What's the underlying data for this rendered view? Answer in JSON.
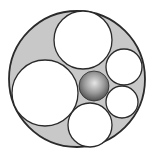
{
  "diagram": {
    "title": "",
    "colors": {
      "background": "#ffffff",
      "outer_fill": "#c8c8c8",
      "inner_fill": "#ffffff",
      "stroke": "#2a2a2a",
      "sphere_highlight": "#e6e6e6",
      "sphere_mid": "#9a9a9a",
      "sphere_edge": "#4a4a4a"
    },
    "outer_circle": {
      "cx": 77,
      "cy": 79,
      "r": 68
    },
    "inner_circles": [
      {
        "id": "top",
        "cx": 83,
        "cy": 40,
        "r": 29
      },
      {
        "id": "left-large",
        "cx": 45,
        "cy": 93,
        "r": 33
      },
      {
        "id": "right-upper",
        "cx": 124,
        "cy": 67,
        "r": 18
      },
      {
        "id": "right-lower",
        "cx": 122,
        "cy": 102,
        "r": 16
      },
      {
        "id": "bottom",
        "cx": 90,
        "cy": 125,
        "r": 22
      }
    ],
    "sphere": {
      "cx": 94,
      "cy": 86,
      "r": 15
    }
  }
}
